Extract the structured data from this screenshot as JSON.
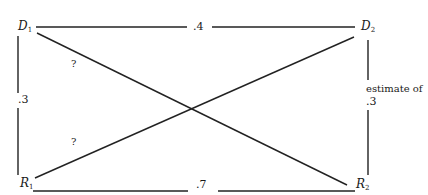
{
  "diagram": {
    "type": "cross-lagged correlation diagram",
    "nodes": {
      "D1": {
        "letter": "D",
        "subscript": "1"
      },
      "D2": {
        "letter": "D",
        "subscript": "2"
      },
      "R1": {
        "letter": "R",
        "subscript": "1"
      },
      "R2": {
        "letter": "R",
        "subscript": "2"
      }
    },
    "edges": {
      "D1_D2": {
        "label": ".4"
      },
      "R1_R2": {
        "label": ".7"
      },
      "D1_R1": {
        "label": ".3"
      },
      "D2_R2": {
        "label_line1": "estimate of",
        "label_line2": ".3"
      },
      "D1_R2": {
        "label": "?"
      },
      "R1_D2": {
        "label": "?"
      }
    },
    "line_color": "#222222"
  }
}
